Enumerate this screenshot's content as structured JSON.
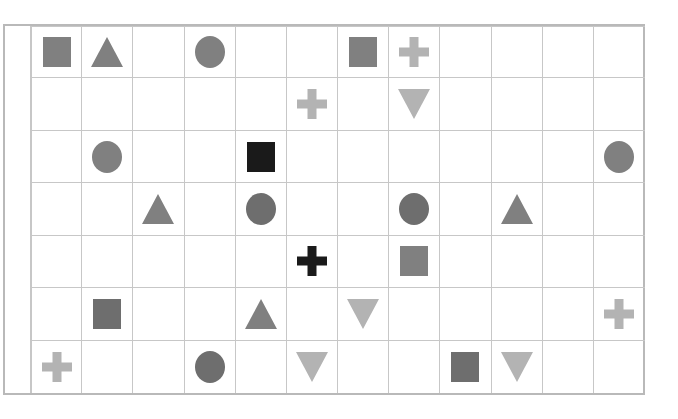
{
  "figure": {
    "kind": "shape-grid",
    "rows": 7,
    "columns": 12,
    "background_color": "#ffffff",
    "frame_color": "#b9b9b9",
    "gridline_color": "#c7c7c7"
  },
  "palette": {
    "gray": "#808080",
    "dark_gray": "#6e6e6e",
    "light_gray": "#b3b3b3",
    "black": "#1a1a1a"
  },
  "chart_data": {
    "type": "heatmap",
    "title": "",
    "xlabel": "",
    "ylabel": "",
    "grid": true,
    "legend": "none",
    "categories": [
      "1",
      "2",
      "3",
      "4",
      "5",
      "6",
      "7",
      "8",
      "9",
      "10",
      "11",
      "12"
    ],
    "row_labels": [
      "1",
      "2",
      "3",
      "4",
      "5",
      "6",
      "7"
    ],
    "shape_types": [
      "square",
      "circle",
      "triangle-up",
      "triangle-down",
      "cross"
    ],
    "cells": [
      [
        {
          "shape": "square",
          "color": "#808080"
        },
        {
          "shape": "triangle-up",
          "color": "#808080"
        },
        null,
        {
          "shape": "circle",
          "color": "#808080"
        },
        null,
        null,
        {
          "shape": "square",
          "color": "#808080"
        },
        {
          "shape": "cross",
          "color": "#b3b3b3"
        },
        null,
        null,
        null,
        null
      ],
      [
        null,
        null,
        null,
        null,
        null,
        {
          "shape": "cross",
          "color": "#b3b3b3"
        },
        null,
        {
          "shape": "triangle-down",
          "color": "#b3b3b3"
        },
        null,
        null,
        null,
        null
      ],
      [
        null,
        {
          "shape": "circle",
          "color": "#808080"
        },
        null,
        null,
        {
          "shape": "square",
          "color": "#1a1a1a"
        },
        null,
        null,
        null,
        null,
        null,
        null,
        {
          "shape": "circle",
          "color": "#808080"
        }
      ],
      [
        null,
        null,
        {
          "shape": "triangle-up",
          "color": "#808080"
        },
        null,
        {
          "shape": "circle",
          "color": "#6e6e6e"
        },
        null,
        null,
        {
          "shape": "circle",
          "color": "#6e6e6e"
        },
        null,
        {
          "shape": "triangle-up",
          "color": "#808080"
        },
        null,
        null
      ],
      [
        null,
        null,
        null,
        null,
        null,
        {
          "shape": "cross",
          "color": "#1a1a1a"
        },
        null,
        {
          "shape": "square",
          "color": "#808080"
        },
        null,
        null,
        null,
        null
      ],
      [
        null,
        {
          "shape": "square",
          "color": "#6e6e6e"
        },
        null,
        null,
        {
          "shape": "triangle-up",
          "color": "#808080"
        },
        null,
        {
          "shape": "triangle-down",
          "color": "#b3b3b3"
        },
        null,
        null,
        null,
        null,
        {
          "shape": "cross",
          "color": "#b3b3b3"
        }
      ],
      [
        {
          "shape": "cross",
          "color": "#b3b3b3"
        },
        null,
        null,
        {
          "shape": "circle",
          "color": "#6e6e6e"
        },
        null,
        {
          "shape": "triangle-down",
          "color": "#b3b3b3"
        },
        null,
        null,
        {
          "shape": "square",
          "color": "#6e6e6e"
        },
        {
          "shape": "triangle-down",
          "color": "#b3b3b3"
        },
        null,
        null
      ]
    ],
    "counts": {
      "square": 7,
      "circle": 6,
      "triangle-up": 4,
      "triangle-down": 4,
      "cross": 5,
      "total_filled": 26,
      "total_cells": 84
    }
  }
}
